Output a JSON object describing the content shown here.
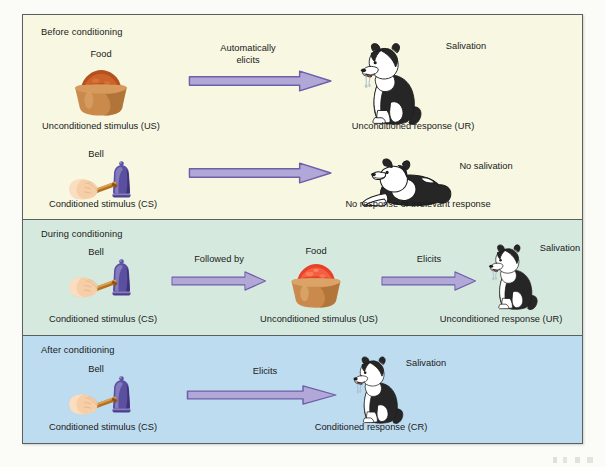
{
  "figure": {
    "colors": {
      "panel_before_bg": "#f7f7e2",
      "panel_during_bg": "#d6e9df",
      "panel_after_bg": "#bedcf0",
      "arrow_fill": "#b1a8d8",
      "arrow_stroke": "#6e5fa8",
      "border": "#5d5f5e",
      "page_bg": "#fbfbf7",
      "text": "#1a1a1a",
      "bell_purple": "#5b4fa0",
      "hand_skin": "#f6cfa8",
      "bowl_tan": "#c98a4b",
      "food_brown": "#b5501f",
      "food_red": "#e8402a",
      "dog_black": "#262626",
      "dog_white": "#ffffff"
    }
  },
  "panels": [
    {
      "id": "before",
      "title": "Before conditioning",
      "rows": [
        {
          "id": "food-ur",
          "stimulus_label": "Food",
          "stimulus_icon": "food-bowl-icon",
          "stimulus_caption": "Unconditioned stimulus (US)",
          "arrow_label": "Automatically\nelicits",
          "arrow_label_line1": "Automatically",
          "arrow_label_line2": "elicits",
          "response_label": "Salivation",
          "response_icon": "dog-sitting-salivating-icon",
          "response_caption": "Unconditioned response (UR)"
        },
        {
          "id": "bell-no-response",
          "stimulus_label": "Bell",
          "stimulus_icon": "hand-ringing-bell-icon",
          "stimulus_caption": "Conditioned stimulus (CS)",
          "arrow_label": "",
          "response_label": "No salivation",
          "response_icon": "dog-lying-down-icon",
          "response_caption": "No response or irrelevant response"
        }
      ]
    },
    {
      "id": "during",
      "title": "During conditioning",
      "steps": [
        {
          "label": "Bell",
          "icon": "hand-ringing-bell-icon",
          "caption": "Conditioned stimulus (CS)"
        },
        {
          "label": "Food",
          "icon": "food-bowl-icon",
          "caption": "Unconditioned stimulus (US)"
        },
        {
          "label": "Salivation",
          "icon": "dog-sitting-salivating-icon",
          "caption": "Unconditioned response (UR)"
        }
      ],
      "arrows": [
        {
          "label": "Followed by"
        },
        {
          "label": "Elicits"
        }
      ]
    },
    {
      "id": "after",
      "title": "After conditioning",
      "steps": [
        {
          "label": "Bell",
          "icon": "hand-ringing-bell-icon",
          "caption": "Conditioned stimulus (CS)"
        },
        {
          "label": "Salivation",
          "icon": "dog-sitting-salivating-icon",
          "caption": "Conditioned response (CR)"
        }
      ],
      "arrows": [
        {
          "label": "Elicits"
        }
      ]
    }
  ]
}
